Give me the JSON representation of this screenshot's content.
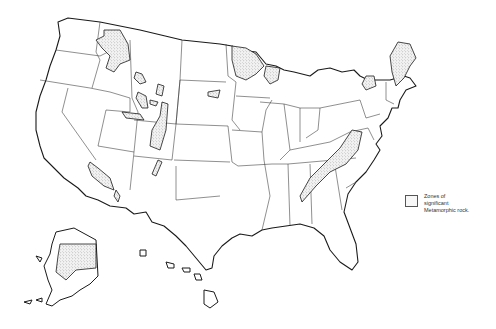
{
  "map": {
    "title": "Zones of significant Metamorphic rock",
    "region": "United States (contiguous US, Alaska, Hawaii)",
    "style": "black line-drawn state borders, stippled zones",
    "colors": {
      "outline": "#1a1a1a",
      "stipple": "#555555",
      "background": "#ffffff"
    }
  },
  "legend": {
    "swatch": "stippled-box",
    "lines": [
      "Zones of",
      "significant",
      "Metamorphic rock."
    ]
  },
  "zones": [
    "Northern Idaho / western Montana",
    "Northern Minnesota",
    "Wyoming ranges",
    "Black Hills (South Dakota)",
    "Colorado Front Range",
    "Uinta / central Utah",
    "Southern California / Arizona ranges",
    "Upper Michigan / Wisconsin",
    "New England (Maine, New Hampshire, Vermont)",
    "Adirondacks (New York)",
    "Appalachian Piedmont (Virginia to Alabama)",
    "Alaska interior belt"
  ]
}
